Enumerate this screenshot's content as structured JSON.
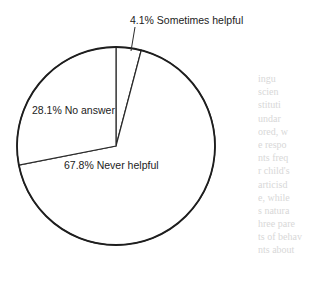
{
  "chart_data": {
    "type": "pie",
    "title": "",
    "start_angle": "12 o'clock",
    "direction": "clockwise",
    "slices": [
      {
        "label": "Sometimes helpful",
        "value": 4.1,
        "display": "4.1% Sometimes helpful",
        "label_position": "outside-top",
        "fill": "#ffffff"
      },
      {
        "label": "Never helpful",
        "value": 67.8,
        "display": "67.8% Never helpful",
        "label_position": "inside",
        "fill": "#ffffff"
      },
      {
        "label": "No answer",
        "value": 28.1,
        "display": "28.1% No answer",
        "label_position": "inside",
        "fill": "#ffffff"
      }
    ],
    "unit": "%",
    "legend": "none"
  },
  "background_bleed_text": [
    "ingu",
    "scien",
    "stituti",
    "undar",
    "ored, w",
    "e respo",
    "nts freq",
    "r child's",
    "articisd",
    "e, while",
    "s natura",
    "hree pare",
    "ts of behav",
    "nts about"
  ]
}
